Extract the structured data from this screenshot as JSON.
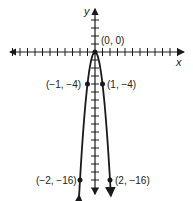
{
  "chart_data": {
    "type": "line",
    "title": "",
    "function": "y = -4x^2",
    "xlabel": "x",
    "ylabel": "y",
    "grid": false,
    "xlim": [
      -12,
      12
    ],
    "ylim": [
      -18,
      6
    ],
    "points": [
      {
        "x": 0,
        "y": 0,
        "label": "(0, 0)"
      },
      {
        "x": -1,
        "y": -4,
        "label": "(−1, −4)"
      },
      {
        "x": 1,
        "y": -4,
        "label": "(1, −4)"
      },
      {
        "x": -2,
        "y": -16,
        "label": "(−2, −16)"
      },
      {
        "x": 2,
        "y": -16,
        "label": "(2, −16)"
      }
    ]
  },
  "labels": {
    "x_axis": "x",
    "y_axis": "y",
    "origin": "(0, 0)",
    "p_neg1": "(−1, −4)",
    "p_pos1": "(1, −4)",
    "p_neg2": "(−2, −16)",
    "p_pos2": "(2, −16)"
  },
  "colors": {
    "ink": "#1a1a1a",
    "background": "#ffffff"
  }
}
